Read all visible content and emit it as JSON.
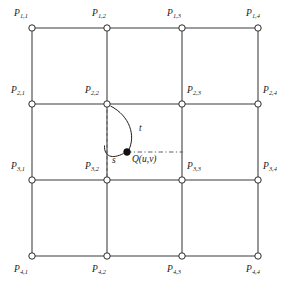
{
  "figure": {
    "background_color": "#ffffff",
    "line_color": "#3a3a3a",
    "dash_color": "#5a5a5a",
    "node_fill": "#ffffff",
    "node_stroke": "#2b2b2b",
    "marker_fill": "#111111",
    "text_color": "#1a1a1a"
  },
  "grid": {
    "rows": 4,
    "cols": 4,
    "x_positions": [
      32,
      107,
      182,
      258
    ],
    "y_positions": [
      28,
      104,
      180,
      256
    ],
    "node_radius": 3.2
  },
  "control_points": [
    {
      "id": "p-1-1",
      "base": "P",
      "sub": "1,1",
      "row": 1,
      "col": 1,
      "x": 32,
      "y": 28,
      "label_x": 14,
      "label_y": 9,
      "align": "above-left"
    },
    {
      "id": "p-1-2",
      "base": "P",
      "sub": "1,2",
      "row": 1,
      "col": 2,
      "x": 107,
      "y": 28,
      "label_x": 92,
      "label_y": 9,
      "align": "above-center"
    },
    {
      "id": "p-1-3",
      "base": "P",
      "sub": "1,3",
      "row": 1,
      "col": 3,
      "x": 182,
      "y": 28,
      "label_x": 167,
      "label_y": 9,
      "align": "above-center"
    },
    {
      "id": "p-1-4",
      "base": "P",
      "sub": "1,4",
      "row": 1,
      "col": 4,
      "x": 258,
      "y": 28,
      "label_x": 246,
      "label_y": 9,
      "align": "above-left"
    },
    {
      "id": "p-2-1",
      "base": "P",
      "sub": "2,1",
      "row": 2,
      "col": 1,
      "x": 32,
      "y": 104,
      "label_x": 11,
      "label_y": 86,
      "align": "above-left"
    },
    {
      "id": "p-2-2",
      "base": "P",
      "sub": "2,2",
      "row": 2,
      "col": 2,
      "x": 107,
      "y": 104,
      "label_x": 85,
      "label_y": 86,
      "align": "above-left"
    },
    {
      "id": "p-2-3",
      "base": "P",
      "sub": "2,3",
      "row": 2,
      "col": 3,
      "x": 182,
      "y": 104,
      "label_x": 187,
      "label_y": 86,
      "align": "above-right"
    },
    {
      "id": "p-2-4",
      "base": "P",
      "sub": "2,4",
      "row": 2,
      "col": 4,
      "x": 258,
      "y": 104,
      "label_x": 263,
      "label_y": 86,
      "align": "above-right"
    },
    {
      "id": "p-3-1",
      "base": "P",
      "sub": "3,1",
      "row": 3,
      "col": 1,
      "x": 32,
      "y": 180,
      "label_x": 11,
      "label_y": 162,
      "align": "above-left"
    },
    {
      "id": "p-3-2",
      "base": "P",
      "sub": "3,2",
      "row": 3,
      "col": 2,
      "x": 107,
      "y": 180,
      "label_x": 85,
      "label_y": 162,
      "align": "above-left"
    },
    {
      "id": "p-3-3",
      "base": "P",
      "sub": "3,3",
      "row": 3,
      "col": 3,
      "x": 182,
      "y": 180,
      "label_x": 187,
      "label_y": 162,
      "align": "above-right"
    },
    {
      "id": "p-3-4",
      "base": "P",
      "sub": "3,4",
      "row": 3,
      "col": 4,
      "x": 258,
      "y": 180,
      "label_x": 263,
      "label_y": 162,
      "align": "above-right"
    },
    {
      "id": "p-4-1",
      "base": "P",
      "sub": "4,1",
      "row": 4,
      "col": 1,
      "x": 32,
      "y": 256,
      "label_x": 14,
      "label_y": 265,
      "align": "below-left"
    },
    {
      "id": "p-4-2",
      "base": "P",
      "sub": "4,2",
      "row": 4,
      "col": 2,
      "x": 107,
      "y": 256,
      "label_x": 92,
      "label_y": 265,
      "align": "below-center"
    },
    {
      "id": "p-4-3",
      "base": "P",
      "sub": "4,3",
      "row": 4,
      "col": 3,
      "x": 182,
      "y": 256,
      "label_x": 167,
      "label_y": 265,
      "align": "below-center"
    },
    {
      "id": "p-4-4",
      "base": "P",
      "sub": "4,4",
      "row": 4,
      "col": 4,
      "x": 258,
      "y": 256,
      "label_x": 246,
      "label_y": 265,
      "align": "below-right"
    }
  ],
  "surface_point": {
    "id": "q-point",
    "label": "Q(u,v)",
    "x": 127,
    "y": 152,
    "marker_radius": 3.4,
    "label_x": 132,
    "label_y": 155
  },
  "parameters": [
    {
      "id": "t-arrow",
      "label": "t",
      "label_x": 139,
      "label_y": 128,
      "description": "curve from P2,2 down to Q"
    },
    {
      "id": "s-arrow",
      "label": "s",
      "label_x": 112,
      "label_y": 156,
      "description": "curve from vertical dashed line to Q"
    }
  ],
  "dashed_guides": [
    {
      "id": "vertical-guide",
      "from_x": 107,
      "from_y": 104,
      "to_x": 107,
      "to_y": 182
    },
    {
      "id": "horizontal-guide",
      "from_x": 127,
      "from_y": 152,
      "to_x": 183,
      "to_y": 152
    }
  ]
}
